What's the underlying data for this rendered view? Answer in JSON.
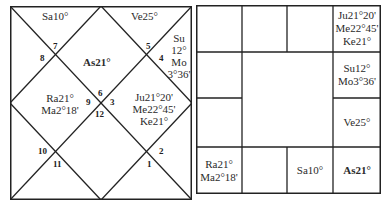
{
  "north_chart": {
    "houses": [
      {
        "house": 1,
        "label": "As21°"
      },
      {
        "house": 2,
        "label": "Ve25°"
      },
      {
        "house": 3,
        "label_lines": [
          "Su",
          "12°",
          "Mo",
          "3°36'"
        ]
      },
      {
        "house": 4,
        "label_lines": [
          "Ju21°20'",
          "Me22°45'",
          "Ke21°"
        ]
      },
      {
        "house": 12,
        "label": "Sa10°"
      },
      {
        "house": 10,
        "label_lines": [
          "Ra21°",
          "Ma2°18'"
        ]
      }
    ],
    "asc_label": "As21°",
    "top_left_label": "Sa10°",
    "top_right_label": "Ve25°",
    "right_label_lines": [
      "Su",
      "12°",
      "Mo",
      "3°36'"
    ],
    "center_right_lines": [
      "Ju21°20'",
      "Me22°45'",
      "Ke21°"
    ],
    "center_left_lines": [
      "Ra21°",
      "Ma2°18'"
    ],
    "sign_numbers": {
      "n7": "7",
      "n8": "8",
      "n5": "5",
      "n4": "4",
      "n6": "6",
      "n9": "9",
      "n3": "3",
      "n12": "12",
      "n10": "10",
      "n11": "11",
      "n2": "2",
      "n1": "1"
    }
  },
  "south_chart": {
    "cells": {
      "r0c3": [
        "Ju21°20'",
        "Me22°45'",
        "Ke21°"
      ],
      "r1c3": [
        "Su12°",
        "Mo3°36'"
      ],
      "r2c3": [
        "Ve25°"
      ],
      "r3c0": [
        "Ra21°",
        "Ma2°18'"
      ],
      "r3c2": [
        "Sa10°"
      ],
      "r3c3": [
        "As21°"
      ]
    }
  },
  "colors": {
    "line": "#222222",
    "text": "#2a2a2a",
    "background": "#ffffff"
  }
}
